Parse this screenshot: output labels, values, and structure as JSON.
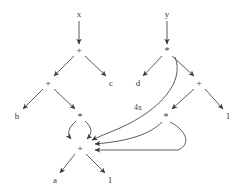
{
  "diagram": {
    "width": 242,
    "height": 194,
    "background_color": "#ffffff",
    "stroke_color": "#4a4a4a",
    "text_color": "#3a3a3a",
    "nodes": [
      {
        "id": "x",
        "label": "x",
        "kind": "leaf",
        "x": 79,
        "y": 14
      },
      {
        "id": "y",
        "label": "y",
        "kind": "leaf",
        "x": 167,
        "y": 14
      },
      {
        "id": "plus_top",
        "label": "+",
        "kind": "operator",
        "x": 79,
        "y": 50
      },
      {
        "id": "mul_top",
        "label": "*",
        "kind": "operator",
        "x": 167,
        "y": 50
      },
      {
        "id": "plus_l2",
        "label": "+",
        "kind": "operator",
        "x": 48,
        "y": 83
      },
      {
        "id": "c",
        "label": "c",
        "kind": "leaf",
        "x": 111,
        "y": 83
      },
      {
        "id": "d",
        "label": "d",
        "kind": "leaf",
        "x": 138,
        "y": 83
      },
      {
        "id": "plus_r2",
        "label": "+",
        "kind": "operator",
        "x": 199,
        "y": 83
      },
      {
        "id": "b",
        "label": "b",
        "kind": "leaf",
        "x": 17,
        "y": 116
      },
      {
        "id": "mul_l3",
        "label": "*",
        "kind": "operator",
        "x": 80,
        "y": 116
      },
      {
        "id": "mul_r3",
        "label": "*",
        "kind": "operator",
        "x": 166,
        "y": 116
      },
      {
        "id": "one_r",
        "label": "1",
        "kind": "leaf",
        "x": 228,
        "y": 116
      },
      {
        "id": "plus_bot",
        "label": "+",
        "kind": "operator",
        "x": 80,
        "y": 148
      },
      {
        "id": "a",
        "label": "a",
        "kind": "leaf",
        "x": 55,
        "y": 180
      },
      {
        "id": "one_b",
        "label": "1",
        "kind": "leaf",
        "x": 110,
        "y": 180
      }
    ],
    "edges": [
      {
        "from": "x",
        "to": "plus_top",
        "style": "straight"
      },
      {
        "from": "y",
        "to": "mul_top",
        "style": "straight"
      },
      {
        "from": "plus_top",
        "to": "plus_l2",
        "style": "straight"
      },
      {
        "from": "plus_top",
        "to": "c",
        "style": "straight"
      },
      {
        "from": "mul_top",
        "to": "d",
        "style": "straight"
      },
      {
        "from": "mul_top",
        "to": "plus_r2",
        "style": "straight"
      },
      {
        "from": "plus_l2",
        "to": "b",
        "style": "straight"
      },
      {
        "from": "plus_l2",
        "to": "mul_l3",
        "style": "straight"
      },
      {
        "from": "plus_r2",
        "to": "mul_r3",
        "style": "straight"
      },
      {
        "from": "plus_r2",
        "to": "one_r",
        "style": "straight"
      },
      {
        "from": "mul_l3",
        "to": "plus_bot",
        "style": "curved-left"
      },
      {
        "from": "mul_l3",
        "to": "plus_bot",
        "style": "curved-right"
      },
      {
        "from": "mul_top",
        "to": "plus_bot",
        "style": "long-curve",
        "label": "4x"
      },
      {
        "from": "mul_r3",
        "to": "plus_bot",
        "style": "loop-inner"
      },
      {
        "from": "mul_r3",
        "to": "plus_bot",
        "style": "loop-outer"
      },
      {
        "from": "plus_bot",
        "to": "a",
        "style": "straight"
      },
      {
        "from": "plus_bot",
        "to": "one_b",
        "style": "straight"
      }
    ],
    "edge_labels": [
      {
        "text": "4x",
        "x": 138,
        "y": 108
      }
    ]
  }
}
